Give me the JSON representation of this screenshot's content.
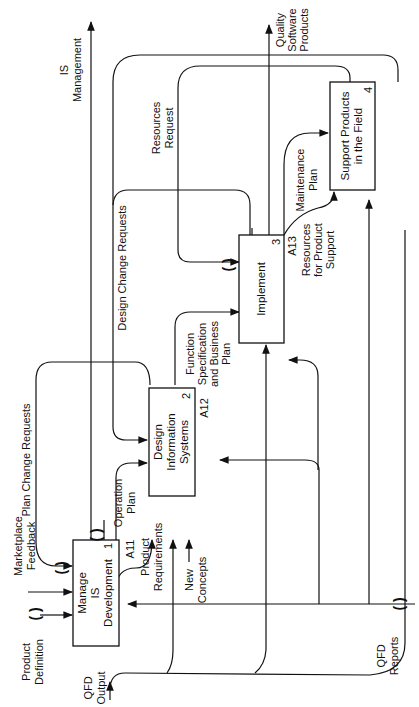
{
  "diagram": {
    "type": "IDEF0",
    "orientation": "rotated-90-ccw",
    "activities": [
      {
        "id": "A11",
        "number": "1",
        "label_lines": [
          "Manage",
          "IS",
          "Development"
        ]
      },
      {
        "id": "A12",
        "number": "2",
        "label_lines": [
          "Design",
          "Information",
          "Systems"
        ]
      },
      {
        "id": "A13",
        "number": "3",
        "label_lines": [
          "Implement"
        ]
      },
      {
        "id": "A14",
        "number": "4",
        "label_lines": [
          "Support Products",
          "in the Field"
        ]
      }
    ],
    "node_refs": {
      "a11": "A11",
      "a12": "A12",
      "a13": "A13"
    },
    "arrows": {
      "product_definition": [
        "Product",
        "Definition"
      ],
      "marketplace_feedback": [
        "Marketplace",
        "Feedback"
      ],
      "plan_change_requests": [
        "Plan Change Requests"
      ],
      "qfd_output": [
        "QFD",
        "Output"
      ],
      "operation_plan": [
        "Operation",
        "Plan"
      ],
      "product_requirements": [
        "Product",
        "Requirements"
      ],
      "new_concepts": [
        "New",
        "Concepts"
      ],
      "design_change_requests": [
        "Design Change Requests"
      ],
      "function_spec": [
        "Function",
        "Specification",
        "and Business",
        "Plan"
      ],
      "resources_request": [
        "Resources",
        "Request"
      ],
      "is_management": [
        "IS",
        "Management"
      ],
      "maintenance_plan": [
        "Maintenance",
        "Plan"
      ],
      "resources_product_support": [
        "Resources",
        "for Product",
        "Support"
      ],
      "quality_software_products": [
        "Quality",
        "Software",
        "Products"
      ],
      "qfd_reports": [
        "QFD",
        "Reports"
      ]
    },
    "tunnel_glyph": "( )"
  }
}
